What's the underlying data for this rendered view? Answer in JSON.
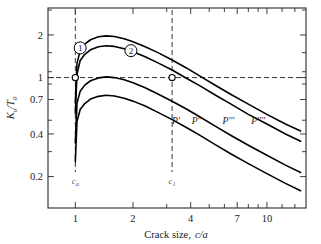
{
  "figure": {
    "background": "#ffffff",
    "frame_color": "#2b2b2b",
    "curve_color": "#000000",
    "dashed_color": "#3a3a3a"
  },
  "axes": {
    "x": {
      "title_static": "Crack size,",
      "title_italic": "c/a",
      "scale": "log",
      "min": 0.72,
      "max": 16.0,
      "tick_labels": [
        "1",
        "2",
        "4",
        "7",
        "10"
      ],
      "tick_values": [
        1,
        2,
        4,
        7,
        10
      ],
      "minor_ticks": [
        1,
        2,
        3,
        4,
        5,
        6,
        7,
        8,
        9,
        10,
        12,
        14
      ]
    },
    "y": {
      "title_main": "K",
      "title_sub1": "n",
      "title_slash": "/T",
      "title_sub2": "0",
      "scale": "log",
      "min": 0.12,
      "max": 3.1,
      "tick_labels": [
        "2",
        "1",
        "0.7",
        "0.4",
        "0.2"
      ],
      "tick_values": [
        2,
        1,
        0.7,
        0.4,
        0.2
      ],
      "minor_ticks": [
        0.2,
        0.3,
        0.4,
        0.5,
        0.7,
        0.9,
        1.0,
        1.1,
        1.5,
        2.0,
        3.0
      ]
    }
  },
  "guides": {
    "horizontal": {
      "label": "K/T = 1",
      "y_value": 1.0
    },
    "vertical_left": {
      "label": "c_a",
      "x_value": 1.0,
      "text_main": "c",
      "text_sub": "a"
    },
    "vertical_right": {
      "label": "c_1",
      "x_value": 3.2,
      "text_main": "c",
      "text_sub": "1"
    }
  },
  "markers": [
    {
      "name": "marker-ca",
      "x": 1.0,
      "y": 1.0
    },
    {
      "name": "marker-c1",
      "x": 3.2,
      "y": 1.0
    }
  ],
  "callouts": [
    {
      "name": "callout-1",
      "label": "1",
      "x": 1.06,
      "y": 1.62
    },
    {
      "name": "callout-2",
      "label": "2",
      "x": 1.95,
      "y": 1.55
    }
  ],
  "chart_data": {
    "type": "line",
    "title": "",
    "xlabel": "Crack size, c/a",
    "ylabel": "K_n/T_0",
    "xscale": "log",
    "yscale": "log",
    "xlim": [
      0.72,
      16.0
    ],
    "ylim": [
      0.12,
      3.1
    ],
    "grid": false,
    "legend": "inline-labels",
    "annotations": [
      "Horizontal dashed line at K_n/T_0 = 1",
      "Vertical dashed line at c/a = 1 (c_a)",
      "Vertical dashed line at c/a = 3.2 (c_1)",
      "Open circle markers at (1, 1) and (3.2, 1)"
    ],
    "series": [
      {
        "name": "P''''",
        "label": "P''''",
        "label_x": 9.0,
        "label_y": 0.47,
        "x": [
          1.0,
          1.02,
          1.06,
          1.12,
          1.2,
          1.32,
          1.45,
          1.6,
          1.8,
          2.0,
          2.3,
          2.7,
          3.2,
          3.8,
          4.5,
          5.4,
          6.5,
          8.0,
          10.0,
          12.5,
          15.0
        ],
        "y": [
          0.66,
          1.26,
          1.55,
          1.72,
          1.85,
          1.94,
          1.97,
          1.95,
          1.88,
          1.79,
          1.66,
          1.5,
          1.33,
          1.17,
          1.02,
          0.88,
          0.76,
          0.65,
          0.55,
          0.47,
          0.42
        ]
      },
      {
        "name": "P'''",
        "label": "P'''",
        "label_x": 6.3,
        "label_y": 0.47,
        "x": [
          1.0,
          1.02,
          1.06,
          1.12,
          1.2,
          1.32,
          1.45,
          1.6,
          1.8,
          2.0,
          2.3,
          2.7,
          3.2,
          3.8,
          4.5,
          5.4,
          6.5,
          8.0,
          10.0,
          12.5,
          15.0
        ],
        "y": [
          0.56,
          1.06,
          1.32,
          1.46,
          1.57,
          1.65,
          1.68,
          1.66,
          1.6,
          1.52,
          1.41,
          1.27,
          1.13,
          0.99,
          0.87,
          0.75,
          0.65,
          0.55,
          0.47,
          0.4,
          0.355
        ]
      },
      {
        "name": "P''",
        "label": "P''",
        "label_x": 4.3,
        "label_y": 0.47,
        "x": [
          1.0,
          1.02,
          1.06,
          1.12,
          1.2,
          1.32,
          1.45,
          1.6,
          1.8,
          2.0,
          2.3,
          2.7,
          3.2,
          3.8,
          4.5,
          5.4,
          6.5,
          8.0,
          10.0,
          12.5,
          15.0
        ],
        "y": [
          0.345,
          0.66,
          0.8,
          0.885,
          0.95,
          0.995,
          1.012,
          1.0,
          0.965,
          0.92,
          0.85,
          0.765,
          0.68,
          0.6,
          0.525,
          0.452,
          0.39,
          0.333,
          0.283,
          0.241,
          0.214
        ]
      },
      {
        "name": "P'",
        "label": "P'",
        "label_x": 3.35,
        "label_y": 0.47,
        "x": [
          1.0,
          1.02,
          1.06,
          1.12,
          1.2,
          1.32,
          1.45,
          1.6,
          1.8,
          2.0,
          2.3,
          2.7,
          3.2,
          3.8,
          4.5,
          5.4,
          6.5,
          8.0,
          10.0,
          12.5,
          15.0
        ],
        "y": [
          0.255,
          0.49,
          0.595,
          0.655,
          0.705,
          0.737,
          0.75,
          0.742,
          0.715,
          0.682,
          0.632,
          0.568,
          0.505,
          0.444,
          0.389,
          0.335,
          0.289,
          0.247,
          0.21,
          0.179,
          0.159
        ]
      }
    ]
  }
}
